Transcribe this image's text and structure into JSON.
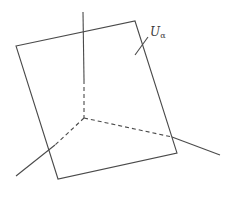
{
  "diagram": {
    "label": {
      "main": "U",
      "subscript": "α",
      "x": 150,
      "y": 26
    },
    "colors": {
      "stroke": "#4a4a4a",
      "background": "#ffffff"
    },
    "plane": {
      "points": [
        [
          16,
          46
        ],
        [
          135,
          21
        ],
        [
          177,
          153
        ],
        [
          58,
          179
        ]
      ]
    },
    "origin": [
      84,
      118
    ],
    "axes": [
      {
        "name": "vertical",
        "solid": [
          [
            83,
            12
          ],
          [
            84,
            80
          ]
        ],
        "dashed": [
          [
            84,
            80
          ],
          [
            84,
            118
          ]
        ]
      },
      {
        "name": "right",
        "dashed": [
          [
            84,
            118
          ],
          [
            172,
            137
          ]
        ],
        "solid": [
          [
            172,
            137
          ],
          [
            220,
            155
          ]
        ]
      },
      {
        "name": "left",
        "dashed": [
          [
            84,
            118
          ],
          [
            55,
            145
          ]
        ],
        "solid": [
          [
            55,
            145
          ],
          [
            16,
            176
          ]
        ]
      }
    ],
    "label_pointer": [
      [
        135,
        55
      ],
      [
        148,
        37
      ]
    ]
  }
}
